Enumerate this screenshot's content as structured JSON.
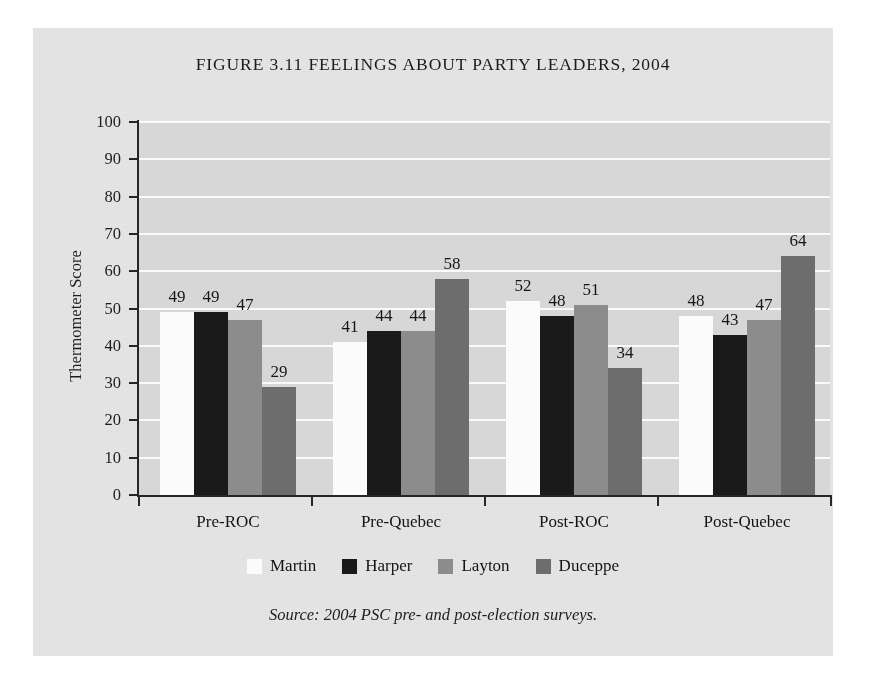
{
  "figure": {
    "title": "FIGURE 3.11 FEELINGS ABOUT PARTY LEADERS, 2004",
    "source_note": "Source: 2004 PSC pre- and post-election surveys.",
    "panel_background": "#e6e6e6",
    "plot_background": "#d7d7d7",
    "gridline_color": "#fafafa",
    "axis_color": "#262626"
  },
  "chart_data": {
    "type": "bar",
    "title": "FIGURE 3.11 FEELINGS ABOUT PARTY LEADERS, 2004",
    "xlabel": "",
    "ylabel": "Thermometer Score",
    "ylim": [
      0,
      100
    ],
    "ytick_step": 10,
    "yticks": [
      0,
      10,
      20,
      30,
      40,
      50,
      60,
      70,
      80,
      90,
      100
    ],
    "ytick_labels": [
      "0",
      "10",
      "20",
      "30",
      "40",
      "50",
      "60",
      "70",
      "80",
      "90",
      "100"
    ],
    "grid": "horizontal",
    "legend_position": "bottom",
    "data_labels": true,
    "categories": [
      "Pre-ROC",
      "Pre-Quebec",
      "Post-ROC",
      "Post-Quebec"
    ],
    "series": [
      {
        "name": "Martin",
        "color": "#fbfbfb",
        "values": [
          49,
          41,
          52,
          48
        ]
      },
      {
        "name": "Harper",
        "color": "#1a1a1a",
        "values": [
          49,
          44,
          48,
          43
        ]
      },
      {
        "name": "Layton",
        "color": "#8c8c8c",
        "values": [
          47,
          44,
          51,
          47
        ]
      },
      {
        "name": "Duceppe",
        "color": "#6d6d6d",
        "values": [
          29,
          58,
          34,
          64
        ]
      }
    ]
  }
}
